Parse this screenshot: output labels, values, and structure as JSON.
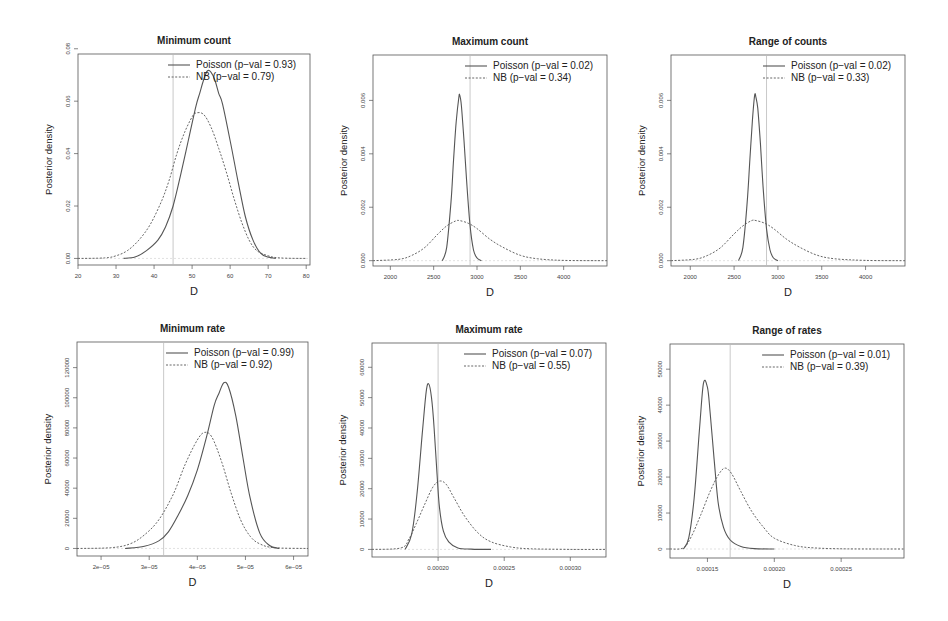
{
  "figure": {
    "background": "#ffffff",
    "line_color": "#555555",
    "obs_line_color": "#bbbbbb"
  },
  "chart_data": [
    {
      "id": "min-count",
      "type": "line",
      "title": "Minimum count",
      "xlabel": "D",
      "ylabel": "Posterior density",
      "box": [
        78,
        54,
        310,
        265
      ],
      "xlim": [
        20,
        81
      ],
      "ylim": [
        -0.0025,
        0.078
      ],
      "xticks": [
        20,
        30,
        40,
        50,
        60,
        70,
        80
      ],
      "xtick_labels": [
        "20",
        "30",
        "40",
        "50",
        "60",
        "70",
        "80"
      ],
      "yticks": [
        0,
        0.02,
        0.04,
        0.06,
        0.08
      ],
      "ytick_labels": [
        "0.00",
        "0.02",
        "0.04",
        "0.06",
        "0.08"
      ],
      "observed": 45,
      "legend": [
        "Poisson (p−val = 0.93)",
        "NB (p−val = 0.79)"
      ],
      "series": [
        {
          "name": "Poisson",
          "style": "solid",
          "x": [
            32,
            35,
            38,
            41,
            43,
            45,
            47,
            49,
            51,
            52,
            53,
            54,
            55,
            56,
            57,
            58,
            60,
            62,
            64,
            66,
            68,
            70,
            72
          ],
          "y": [
            0,
            0.0005,
            0.003,
            0.007,
            0.012,
            0.02,
            0.032,
            0.045,
            0.058,
            0.063,
            0.068,
            0.0715,
            0.071,
            0.068,
            0.063,
            0.059,
            0.045,
            0.03,
            0.016,
            0.007,
            0.002,
            0.0005,
            0
          ]
        },
        {
          "name": "NB",
          "style": "dashed",
          "x": [
            20,
            27,
            30,
            33,
            36,
            39,
            42,
            44,
            46,
            48,
            50,
            51,
            53,
            55,
            57,
            59,
            61,
            63,
            65,
            67,
            70,
            73,
            80
          ],
          "y": [
            0,
            0.0002,
            0.001,
            0.003,
            0.007,
            0.013,
            0.022,
            0.03,
            0.04,
            0.048,
            0.054,
            0.0555,
            0.055,
            0.05,
            0.042,
            0.033,
            0.023,
            0.014,
            0.007,
            0.003,
            0.001,
            0.0002,
            0
          ]
        }
      ]
    },
    {
      "id": "max-count",
      "type": "line",
      "title": "Maximum count",
      "xlabel": "D",
      "ylabel": "Posterior density",
      "box": [
        373,
        55,
        607,
        266
      ],
      "xlim": [
        1800,
        4500
      ],
      "ylim": [
        -0.0002,
        0.0077
      ],
      "xticks": [
        2000,
        2500,
        3000,
        3500,
        4000
      ],
      "xtick_labels": [
        "2000",
        "2500",
        "3000",
        "3500",
        "4000"
      ],
      "yticks": [
        0,
        0.002,
        0.004,
        0.006
      ],
      "ytick_labels": [
        "0.000",
        "0.002",
        "0.004",
        "0.006"
      ],
      "observed": 2920,
      "legend": [
        "Poisson (p−val = 0.02)",
        "NB (p−val = 0.34)"
      ],
      "series": [
        {
          "name": "Poisson",
          "style": "solid",
          "x": [
            2600,
            2650,
            2700,
            2730,
            2760,
            2790,
            2800,
            2820,
            2850,
            2880,
            2920,
            2960,
            3000,
            3050
          ],
          "y": [
            0,
            0.0005,
            0.0022,
            0.0038,
            0.0052,
            0.0061,
            0.0062,
            0.0058,
            0.0045,
            0.003,
            0.0013,
            0.0004,
            0.0001,
            0
          ]
        },
        {
          "name": "NB",
          "style": "dashed",
          "x": [
            1800,
            2100,
            2250,
            2400,
            2550,
            2650,
            2750,
            2800,
            2900,
            3000,
            3150,
            3300,
            3500,
            3700,
            4000,
            4500
          ],
          "y": [
            0,
            5e-05,
            0.0002,
            0.0005,
            0.001,
            0.0013,
            0.00148,
            0.0015,
            0.0014,
            0.0012,
            0.0008,
            0.0005,
            0.0002,
            7e-05,
            1e-05,
            0
          ]
        }
      ]
    },
    {
      "id": "range-counts",
      "type": "line",
      "title": "Range of counts",
      "xlabel": "D",
      "ylabel": "Posterior density",
      "box": [
        671,
        55,
        905,
        266
      ],
      "xlim": [
        1780,
        4450
      ],
      "ylim": [
        -0.0002,
        0.0077
      ],
      "xticks": [
        2000,
        2500,
        3000,
        3500,
        4000
      ],
      "xtick_labels": [
        "2000",
        "2500",
        "3000",
        "3500",
        "4000"
      ],
      "yticks": [
        0,
        0.002,
        0.004,
        0.006
      ],
      "ytick_labels": [
        "0.000",
        "0.002",
        "0.004",
        "0.006"
      ],
      "observed": 2870,
      "legend": [
        "Poisson (p−val = 0.02)",
        "NB (p−val = 0.33)"
      ],
      "series": [
        {
          "name": "Poisson",
          "style": "solid",
          "x": [
            2550,
            2600,
            2650,
            2680,
            2710,
            2735,
            2750,
            2770,
            2800,
            2830,
            2870,
            2910,
            2950,
            3000
          ],
          "y": [
            0,
            0.0005,
            0.0022,
            0.0038,
            0.0053,
            0.0062,
            0.0061,
            0.0057,
            0.0044,
            0.0028,
            0.0012,
            0.0004,
            0.0001,
            0
          ]
        },
        {
          "name": "NB",
          "style": "dashed",
          "x": [
            1780,
            2050,
            2200,
            2350,
            2500,
            2600,
            2700,
            2750,
            2850,
            2950,
            3100,
            3250,
            3450,
            3650,
            4000,
            4450
          ],
          "y": [
            0,
            5e-05,
            0.0002,
            0.0005,
            0.001,
            0.0013,
            0.0015,
            0.0015,
            0.0014,
            0.0012,
            0.0008,
            0.0005,
            0.0002,
            7e-05,
            1e-05,
            0
          ]
        }
      ]
    },
    {
      "id": "min-rate",
      "type": "line",
      "title": "Minimum rate",
      "xlabel": "D",
      "ylabel": "Posterior density",
      "box": [
        77,
        342,
        308,
        556
      ],
      "xlim": [
        1.5e-05,
        6.3e-05
      ],
      "ylim": [
        -5000,
        137000
      ],
      "xticks": [
        2e-05,
        3e-05,
        4e-05,
        5e-05,
        6e-05
      ],
      "xtick_labels": [
        "2e−05",
        "3e−05",
        "4e−05",
        "5e−05",
        "6e−05"
      ],
      "yticks": [
        0,
        20000,
        40000,
        60000,
        80000,
        100000,
        120000
      ],
      "ytick_labels": [
        "0",
        "20000",
        "40000",
        "60000",
        "80000",
        "100000",
        "120000"
      ],
      "observed": 3.3e-05,
      "legend": [
        "Poisson (p−val = 0.99)",
        "NB (p−val = 0.92)"
      ],
      "series": [
        {
          "name": "Poisson",
          "style": "solid",
          "x": [
            2.5e-05,
            2.9e-05,
            3.2e-05,
            3.4e-05,
            3.6e-05,
            3.8e-05,
            4e-05,
            4.2e-05,
            4.35e-05,
            4.45e-05,
            4.55e-05,
            4.65e-05,
            4.8e-05,
            4.95e-05,
            5.1e-05,
            5.3e-05,
            5.5e-05,
            5.7e-05
          ],
          "y": [
            0,
            1500,
            5000,
            11000,
            22000,
            35000,
            52000,
            75000,
            95000,
            103000,
            110000,
            107000,
            88000,
            60000,
            33000,
            10000,
            2000,
            0
          ]
        },
        {
          "name": "NB",
          "style": "dashed",
          "x": [
            1.5e-05,
            2.2e-05,
            2.6e-05,
            2.9e-05,
            3.2e-05,
            3.5e-05,
            3.75e-05,
            4e-05,
            4.15e-05,
            4.3e-05,
            4.5e-05,
            4.7e-05,
            4.9e-05,
            5.1e-05,
            5.3e-05,
            5.6e-05,
            6.3e-05
          ],
          "y": [
            0,
            500,
            3000,
            9000,
            19000,
            36000,
            56000,
            72000,
            77000,
            74000,
            58000,
            37000,
            19000,
            8000,
            3000,
            500,
            0
          ]
        }
      ]
    },
    {
      "id": "max-rate",
      "type": "line",
      "title": "Maximum rate",
      "xlabel": "D",
      "ylabel": "Posterior density",
      "box": [
        372,
        343,
        606,
        557
      ],
      "xlim": [
        0.00015,
        0.000327
      ],
      "ylim": [
        -2500,
        68000
      ],
      "xticks": [
        0.0002,
        0.00025,
        0.0003
      ],
      "xtick_labels": [
        "0.00020",
        "0.00025",
        "0.00030"
      ],
      "yticks": [
        0,
        10000,
        20000,
        30000,
        40000,
        50000,
        60000
      ],
      "ytick_labels": [
        "0",
        "10000",
        "20000",
        "30000",
        "40000",
        "50000",
        "60000"
      ],
      "observed": 0.0002,
      "legend": [
        "Poisson (p−val = 0.07)",
        "NB (p−val = 0.55)"
      ],
      "series": [
        {
          "name": "Poisson",
          "style": "solid",
          "x": [
            0.000175,
            0.00018,
            0.000184,
            0.000188,
            0.000191,
            0.000193,
            0.000195,
            0.000197,
            0.000199,
            0.000201,
            0.000204,
            0.000208,
            0.000215,
            0.000225,
            0.00024
          ],
          "y": [
            0,
            5000,
            18000,
            38000,
            52000,
            54500,
            50000,
            40000,
            26000,
            14000,
            6000,
            2500,
            500,
            100,
            0
          ]
        },
        {
          "name": "NB",
          "style": "dashed",
          "x": [
            0.00015,
            0.000172,
            0.000178,
            0.000184,
            0.00019,
            0.000196,
            0.000201,
            0.000206,
            0.000212,
            0.00022,
            0.00023,
            0.00024,
            0.000255,
            0.00027,
            0.0003,
            0.000327
          ],
          "y": [
            0,
            500,
            3500,
            9000,
            15000,
            20500,
            22500,
            21500,
            17000,
            11000,
            5500,
            2500,
            800,
            200,
            20,
            0
          ]
        }
      ]
    },
    {
      "id": "range-rates",
      "type": "line",
      "title": "Range of rates",
      "xlabel": "D",
      "ylabel": "Posterior density",
      "box": [
        670,
        344,
        904,
        558
      ],
      "xlim": [
        0.000122,
        0.000297
      ],
      "ylim": [
        -2500,
        57000
      ],
      "xticks": [
        0.00015,
        0.0002,
        0.00025
      ],
      "xtick_labels": [
        "0.00015",
        "0.00020",
        "0.00025"
      ],
      "yticks": [
        0,
        10000,
        20000,
        30000,
        40000,
        50000
      ],
      "ytick_labels": [
        "0",
        "10000",
        "20000",
        "30000",
        "40000",
        "50000"
      ],
      "observed": 0.000167,
      "legend": [
        "Poisson (p−val = 0.01)",
        "NB (p−val = 0.39)"
      ],
      "series": [
        {
          "name": "Poisson",
          "style": "solid",
          "x": [
            0.000132,
            0.000136,
            0.00014,
            0.000144,
            0.000147,
            0.00015,
            0.000152,
            0.000155,
            0.000158,
            0.000162,
            0.000167,
            0.000175,
            0.000185,
            0.0002
          ],
          "y": [
            0,
            3000,
            14000,
            33000,
            46000,
            45000,
            38000,
            25000,
            13000,
            6000,
            2500,
            700,
            100,
            0
          ]
        },
        {
          "name": "NB",
          "style": "dashed",
          "x": [
            0.000122,
            0.000132,
            0.000138,
            0.000145,
            0.000152,
            0.000158,
            0.000163,
            0.000168,
            0.000175,
            0.000183,
            0.000192,
            0.0002,
            0.000215,
            0.00023,
            0.000255,
            0.000297
          ],
          "y": [
            0,
            300,
            3500,
            9500,
            16000,
            20500,
            22500,
            21000,
            16000,
            10500,
            6000,
            3000,
            1000,
            300,
            40,
            0
          ]
        }
      ]
    }
  ]
}
